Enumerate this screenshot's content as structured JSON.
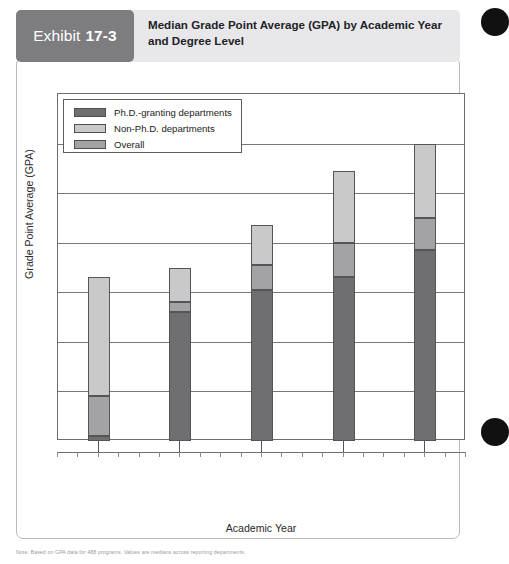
{
  "exhibit": {
    "tag_label": "Exhibit",
    "tag_number": "17-3",
    "title": "Median Grade Point Average (GPA) by Academic Year and Degree Level"
  },
  "footnote": {
    "text": "Note: Based on GPA data for 488 programs. Values are medians across reporting departments."
  },
  "legend": {
    "position": "top-left-inside-plot",
    "items": [
      {
        "label": "Ph.D.-granting departments",
        "color": "#6f6f72"
      },
      {
        "label": "Non-Ph.D. departments",
        "color": "#c9c9ca"
      },
      {
        "label": "Overall",
        "color": "#a3a3a5"
      }
    ]
  },
  "axes": {
    "y_title": "Grade Point Average (GPA)",
    "x_title": "Academic Year",
    "y_ticks": [
      "2.4",
      "2.5",
      "2.6",
      "2.7",
      "2.8",
      "2.9",
      "3.0",
      "3.1"
    ],
    "y_min": 2.4,
    "y_max": 3.1,
    "grid": true
  },
  "chart_data": {
    "type": "bar",
    "title": "Median Grade Point Average (GPA) by Academic Year and Degree Level",
    "xlabel": "Academic Year",
    "ylabel": "Grade Point Average (GPA)",
    "ylim": [
      2.4,
      3.1
    ],
    "ytick_step": 0.1,
    "grid": true,
    "legend_position": "upper left",
    "note": "Stacked-appearance column chart; each column shows three overlapping GPA markers per academic year.",
    "categories": [
      "1984-1985",
      "1989-1990",
      "1994-1995",
      "1999-2000",
      "2004-2005"
    ],
    "series": [
      {
        "name": "Ph.D.-granting departments",
        "color": "#6f6f72",
        "values": [
          2.41,
          2.66,
          2.705,
          2.73,
          2.785
        ]
      },
      {
        "name": "Overall",
        "color": "#a3a3a5",
        "values": [
          2.49,
          2.68,
          2.755,
          2.8,
          2.85
        ]
      },
      {
        "name": "Non-Ph.D. departments",
        "color": "#c9c9ca",
        "values": [
          2.73,
          2.75,
          2.835,
          2.945,
          3.0
        ]
      }
    ]
  },
  "colors": {
    "phd": "#6f6f72",
    "nonphd": "#c9c9ca",
    "overall": "#a3a3a5",
    "banner_bg": "#e8e8ea",
    "tag_bg": "#7d7d80",
    "axis": "#6e6e72"
  }
}
